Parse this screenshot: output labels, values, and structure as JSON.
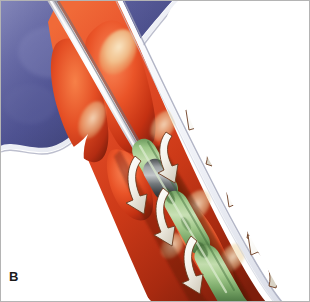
{
  "figure": {
    "panel_label": "B",
    "width": 310,
    "height": 302,
    "background_color": "#ffffff",
    "frame_color": "#b4b4b4"
  },
  "colors": {
    "vessel_outer_blue_light": "#6f72a8",
    "vessel_outer_blue_mid": "#4d5090",
    "vessel_outer_blue_dark": "#353a6f",
    "vessel_wall_line": "#e9eaf2",
    "vessel_wall_shadow": "#9a9cb4",
    "plaque_red_bright": "#e8502a",
    "plaque_red_mid": "#c93a18",
    "plaque_red_dark": "#8e2410",
    "plaque_highlight": "#f6d9a8",
    "plaque_pale_yellow": "#efe0b4",
    "lumen_shadow": "#5c1608",
    "catheter_white": "#fdfdfd",
    "catheter_shadow": "#9d9da6",
    "device_green_light": "#b9d6a2",
    "device_green_mid": "#8cb878",
    "device_green_dark": "#5d8a52",
    "device_metal_light": "#b9bcbe",
    "device_metal_dark": "#3a3d40",
    "arrow_fill": "#fbfbf8",
    "arrow_outline": "#4a2410",
    "label_color": "#1a1a1a"
  },
  "elements": {
    "vessel_exterior": {
      "name": "artery outer wall",
      "color_role": "vessel_outer_blue_mid"
    },
    "vessel_wall_line": {
      "name": "intimal wall boundary",
      "color_role": "vessel_wall_line"
    },
    "plaque": {
      "name": "atherosclerotic plaque",
      "color_role": "plaque_red_bright"
    },
    "guidewire": {
      "name": "guidewire catheter shaft",
      "color_role": "catheter_white"
    },
    "device_body": {
      "name": "atherectomy device body",
      "color_role": "device_green_mid"
    },
    "device_band": {
      "name": "metallic cutter band",
      "color_role": "device_metal_dark"
    },
    "flow_arrows": {
      "name": "debris and flow direction arrows",
      "count": 8,
      "color_role": "arrow_fill"
    }
  }
}
